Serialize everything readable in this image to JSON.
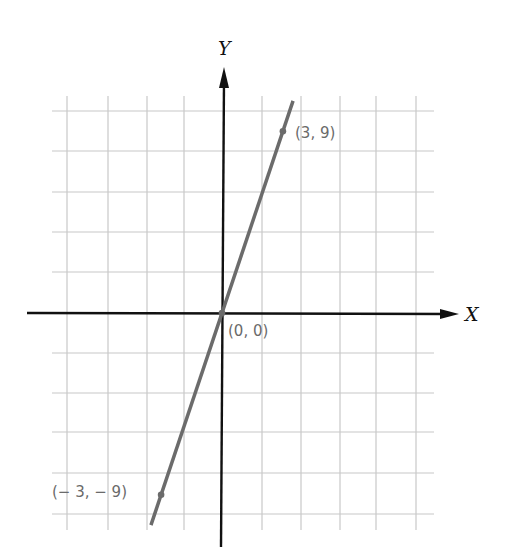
{
  "chart_data": {
    "type": "line",
    "title": "",
    "xlabel": "X",
    "ylabel": "Y",
    "equation": "y = 3x",
    "grid": true,
    "grid_spacing_units": 2,
    "xlim": [
      -10,
      10
    ],
    "ylim": [
      -10,
      10
    ],
    "series": [
      {
        "name": "y = 3x",
        "x": [
          -3.5,
          3.5
        ],
        "y": [
          -10.5,
          10.5
        ],
        "color": "#6b6b6b"
      }
    ],
    "points": [
      {
        "x": 3,
        "y": 9,
        "label": "(3, 9)"
      },
      {
        "x": 0,
        "y": 0,
        "label": "(0, 0)"
      },
      {
        "x": -3,
        "y": -9,
        "label": "(− 3, − 9)"
      }
    ]
  },
  "colors": {
    "grid": "#c8c8c8",
    "axis": "#111111",
    "line": "#6b6b6b",
    "label": "#6a6a6a"
  }
}
